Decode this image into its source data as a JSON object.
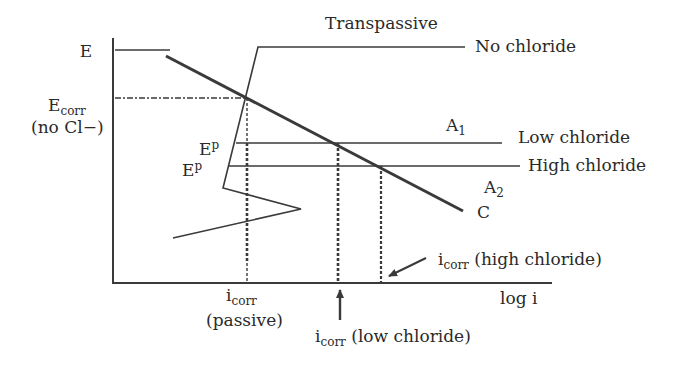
{
  "diagram": {
    "axes": {
      "y_label": "E",
      "x_label": "log i"
    },
    "labels": {
      "transpassive": "Transpassive",
      "no_chloride": "No chloride",
      "low_chloride": "Low chloride",
      "high_chloride": "High chloride",
      "a1": "A",
      "a1_sub": "1",
      "a2": "A",
      "a2_sub": "2",
      "c": "C",
      "ecorr_main": "E",
      "ecorr_sub": "corr",
      "ecorr_note": "(no Cl−)",
      "ep1_main": "E",
      "ep1_sub": "p",
      "ep2_main": "E",
      "ep2_sub": "p",
      "icorr_passive_main": "i",
      "icorr_passive_sub": "corr",
      "icorr_passive_note": "(passive)",
      "icorr_low_main": "i",
      "icorr_low_sub": "corr",
      "icorr_low_note": " (low chloride)",
      "icorr_high_main": "i",
      "icorr_high_sub": "corr",
      "icorr_high_note": " (high chloride)"
    },
    "colors": {
      "line": "#3a3a3a",
      "text": "#2a2a2a",
      "background": "#ffffff"
    }
  }
}
